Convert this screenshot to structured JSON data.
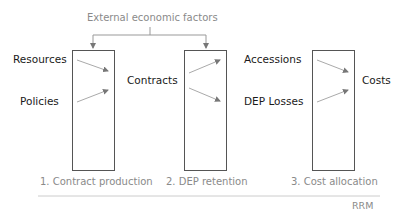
{
  "top_label": "External economic factors",
  "inputs": {
    "resources": "Resources",
    "policies": "Policies"
  },
  "intermediate": {
    "contracts": "Contracts",
    "accessions": "Accessions",
    "dep_losses": "DEP Losses"
  },
  "outputs": {
    "costs": "Costs"
  },
  "stages": [
    {
      "label": "1. Contract production"
    },
    {
      "label": "2. DEP retention"
    },
    {
      "label": "3. Cost allocation"
    }
  ],
  "footer": "RRM",
  "colors": {
    "line": "#555555",
    "arrow": "#9a9a9a",
    "muted_text": "#8a8a8a",
    "text": "#1a1a1a"
  }
}
